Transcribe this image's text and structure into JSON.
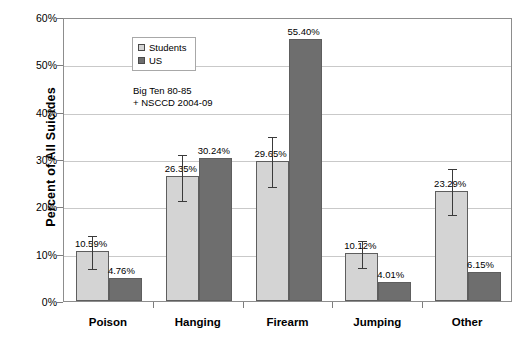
{
  "chart_data": {
    "type": "bar",
    "title": "",
    "xlabel": "",
    "ylabel": "Percent of All Suicides",
    "ylim": [
      0,
      60
    ],
    "ytick_labels": [
      "0%",
      "10%",
      "20%",
      "30%",
      "40%",
      "50%",
      "60%"
    ],
    "ytick_values": [
      0,
      10,
      20,
      30,
      40,
      50,
      60
    ],
    "grid": true,
    "legend_position": "top-left-inside",
    "categories": [
      "Poison",
      "Hanging",
      "Firearm",
      "Jumping",
      "Other"
    ],
    "series": [
      {
        "name": "Students",
        "color": "#d4d4d4",
        "values": [
          10.59,
          26.35,
          29.65,
          10.12,
          23.29
        ],
        "labels": [
          "10.59%",
          "26.35%",
          "29.65%",
          "10.12%",
          "23.29%"
        ],
        "error_low": [
          7.0,
          21.4,
          24.3,
          7.2,
          18.3
        ],
        "error_high": [
          14.2,
          31.3,
          35.0,
          13.0,
          28.3
        ]
      },
      {
        "name": "US",
        "color": "#6e6e6e",
        "values": [
          4.76,
          30.24,
          55.4,
          4.01,
          6.15
        ],
        "labels": [
          "4.76%",
          "30.24%",
          "55.40%",
          "4.01%",
          "6.15%"
        ],
        "error_low": [
          null,
          null,
          null,
          null,
          null
        ],
        "error_high": [
          null,
          null,
          null,
          null,
          null
        ]
      }
    ],
    "annotations": [
      "Big  Ten 80-85",
      "+ NSCCD 2004-09"
    ]
  },
  "legend": {
    "items": [
      {
        "label": "Students",
        "swatch": "students"
      },
      {
        "label": "US",
        "swatch": "us"
      }
    ]
  },
  "axes": {
    "y_title": "Percent of All Suicides"
  }
}
